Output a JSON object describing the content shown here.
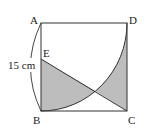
{
  "diagram": {
    "type": "geometry",
    "shape": "square ABCD with quarter-circle arc and segment EC",
    "labels": {
      "A": "A",
      "B": "B",
      "C": "C",
      "D": "D",
      "E": "E"
    },
    "dimension_label": "15 cm",
    "colors": {
      "line": "#333333",
      "shade": "#bdbdbd",
      "background": "#ffffff"
    }
  }
}
